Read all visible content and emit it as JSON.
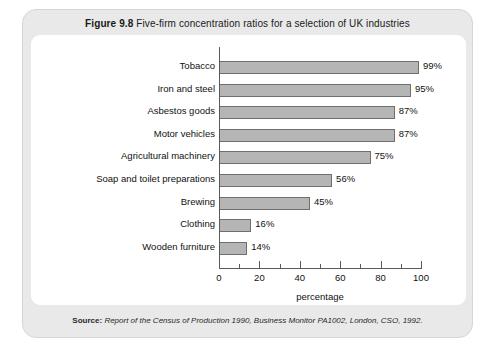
{
  "figure": {
    "number": "Figure 9.8",
    "caption": "Five-firm concentration ratios for a selection of UK industries"
  },
  "source": {
    "label": "Source:",
    "text": "Report of the Census of Production 1990, Business Monitor PA1002, London, CSO, 1992."
  },
  "chart_data": {
    "type": "bar",
    "orientation": "horizontal",
    "title": "Five-firm concentration ratios for a selection of UK industries",
    "categories": [
      "Tobacco",
      "Iron and steel",
      "Asbestos goods",
      "Motor vehicles",
      "Agricultural machinery",
      "Soap and toilet preparations",
      "Brewing",
      "Clothing",
      "Wooden furniture"
    ],
    "values": [
      99,
      95,
      87,
      87,
      75,
      56,
      45,
      16,
      14
    ],
    "data_labels": [
      "99%",
      "95%",
      "87%",
      "87%",
      "75%",
      "56%",
      "45%",
      "16%",
      "14%"
    ],
    "xlabel": "percentage",
    "ylabel": "",
    "xlim": [
      0,
      100
    ],
    "xticks": [
      0,
      20,
      40,
      60,
      80,
      100
    ],
    "xtick_labels": [
      "0",
      "20",
      "40",
      "60",
      "80",
      "100"
    ],
    "minor_tick_interval": 10,
    "grid": false,
    "legend": false,
    "bar_color": "#b5b5b5",
    "bar_edge_color": "#6f6f6f"
  }
}
